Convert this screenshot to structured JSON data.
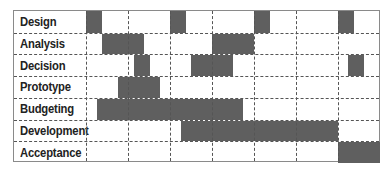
{
  "chart_data": {
    "type": "gantt",
    "title": "",
    "columns": 7,
    "x_origin_px": 86,
    "column_width_px": 42,
    "bar_color": "#5f5f5f",
    "grid": "dashed",
    "rows": [
      {
        "label": "Design",
        "bars": [
          [
            0,
            0.38
          ],
          [
            2,
            2.38
          ],
          [
            4,
            4.38
          ],
          [
            6,
            6.38
          ]
        ]
      },
      {
        "label": "Analysis",
        "bars": [
          [
            0.38,
            1.38
          ],
          [
            3,
            4
          ]
        ]
      },
      {
        "label": "Decision",
        "bars": [
          [
            1.14,
            1.52
          ],
          [
            2.5,
            3.5
          ],
          [
            6.24,
            6.62
          ]
        ]
      },
      {
        "label": "Prototype",
        "bars": [
          [
            0.76,
            1.76
          ]
        ]
      },
      {
        "label": "Budgeting",
        "bars": [
          [
            0.26,
            3.74
          ]
        ]
      },
      {
        "label": "Development",
        "bars": [
          [
            2.26,
            6
          ]
        ]
      },
      {
        "label": "Acceptance",
        "bars": [
          [
            6,
            7
          ]
        ]
      }
    ]
  }
}
